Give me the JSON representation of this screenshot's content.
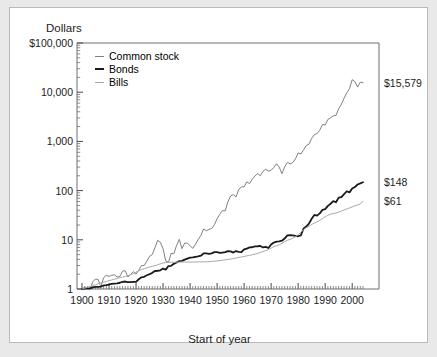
{
  "figure": {
    "y_axis_title": "Dollars",
    "x_axis_title": "Start of year"
  },
  "legend": {
    "items": [
      {
        "label": "Common stock",
        "color": "#808080",
        "width": 1.0
      },
      {
        "label": "Bonds",
        "color": "#1a1a1a",
        "width": 1.8
      },
      {
        "label": "Bills",
        "color": "#a8a8a8",
        "width": 1.0
      }
    ]
  },
  "end_labels": [
    {
      "name": "common-stock-end-label",
      "text": "$15,579",
      "value": 15579,
      "y_px": 80
    },
    {
      "name": "bonds-end-label",
      "text": "$148",
      "value": 148,
      "y_px": 188
    },
    {
      "name": "bills-end-label",
      "text": "$61",
      "value": 61,
      "y_px": 206
    }
  ],
  "chart_data": {
    "type": "line",
    "title": "",
    "xlabel": "Start of year",
    "ylabel": "Dollars",
    "yscale": "log",
    "ylim": [
      1,
      100000
    ],
    "xlim": [
      1900,
      2004
    ],
    "grid": false,
    "legend_position": "top-left inside",
    "ytick_labels": [
      "$100,000",
      "10,000",
      "1,000",
      "100",
      "10",
      "1"
    ],
    "ytick_values": [
      100000,
      10000,
      1000,
      100,
      10,
      1
    ],
    "xtick_labels": [
      "1900",
      "1910",
      "1920",
      "1930",
      "1940",
      "1950",
      "1960",
      "1970",
      "1980",
      "1990",
      "2000"
    ],
    "xtick_values": [
      1900,
      1910,
      1920,
      1930,
      1940,
      1950,
      1960,
      1970,
      1980,
      1990,
      2000
    ],
    "x": [
      1900,
      1901,
      1902,
      1903,
      1904,
      1905,
      1906,
      1907,
      1908,
      1909,
      1910,
      1911,
      1912,
      1913,
      1914,
      1915,
      1916,
      1917,
      1918,
      1919,
      1920,
      1921,
      1922,
      1923,
      1924,
      1925,
      1926,
      1927,
      1928,
      1929,
      1930,
      1931,
      1932,
      1933,
      1934,
      1935,
      1936,
      1937,
      1938,
      1939,
      1940,
      1941,
      1942,
      1943,
      1944,
      1945,
      1946,
      1947,
      1948,
      1949,
      1950,
      1951,
      1952,
      1953,
      1954,
      1955,
      1956,
      1957,
      1958,
      1959,
      1960,
      1961,
      1962,
      1963,
      1964,
      1965,
      1966,
      1967,
      1968,
      1969,
      1970,
      1971,
      1972,
      1973,
      1974,
      1975,
      1976,
      1977,
      1978,
      1979,
      1980,
      1981,
      1982,
      1983,
      1984,
      1985,
      1986,
      1987,
      1988,
      1989,
      1990,
      1991,
      1992,
      1993,
      1994,
      1995,
      1996,
      1997,
      1998,
      1999,
      2000,
      2001,
      2002,
      2003,
      2004
    ],
    "series": [
      {
        "name": "Common stock",
        "color": "#808080",
        "values": [
          1,
          1.07,
          0.95,
          0.9,
          1.4,
          1.6,
          1.55,
          1.1,
          1.7,
          1.9,
          1.8,
          1.9,
          1.95,
          1.75,
          1.8,
          2.3,
          2.35,
          1.75,
          2.0,
          2.25,
          2.0,
          2.4,
          3.0,
          3.0,
          3.7,
          4.6,
          5.0,
          6.9,
          9.8,
          8.9,
          6.6,
          3.7,
          3.5,
          5.3,
          5.2,
          7.7,
          10.2,
          6.6,
          8.6,
          8.5,
          7.6,
          6.7,
          8.1,
          10.2,
          12.2,
          16.6,
          15.3,
          16.2,
          17.0,
          20.2,
          26.7,
          33.1,
          39.2,
          38.8,
          59.2,
          77.9,
          83.0,
          74.0,
          106.0,
          118.7,
          119.3,
          151.4,
          138.2,
          169.6,
          197.8,
          222.6,
          200.1,
          248.1,
          272.0,
          249.0,
          259.0,
          296.0,
          352.0,
          300.0,
          220.6,
          302.8,
          375.3,
          348.6,
          371.4,
          440.0,
          582.8,
          554.0,
          673.2,
          825.1,
          877.4,
          1155.8,
          1371.2,
          1443.3,
          1682.5,
          2214.3,
          2145.5,
          2799.0,
          3013.0,
          3316.0,
          3359.0,
          4620.0,
          5680.0,
          7575.0,
          9740.0,
          11790.0,
          18000.0,
          16350.0,
          12700.0,
          16000.0,
          15579.0
        ]
      },
      {
        "name": "Bonds",
        "color": "#1a1a1a",
        "values": [
          1,
          1.02,
          1.03,
          1.03,
          1.08,
          1.1,
          1.1,
          1.12,
          1.18,
          1.2,
          1.23,
          1.27,
          1.29,
          1.3,
          1.34,
          1.4,
          1.42,
          1.38,
          1.38,
          1.4,
          1.4,
          1.58,
          1.73,
          1.77,
          1.9,
          2.0,
          2.13,
          2.32,
          2.35,
          2.4,
          2.6,
          2.48,
          2.93,
          2.96,
          3.25,
          3.45,
          3.7,
          3.72,
          3.95,
          4.15,
          4.35,
          4.38,
          4.5,
          4.6,
          4.75,
          5.3,
          5.3,
          5.2,
          5.3,
          5.6,
          5.6,
          5.4,
          5.5,
          5.6,
          5.9,
          5.8,
          5.5,
          5.9,
          5.7,
          5.6,
          6.4,
          6.6,
          7.0,
          7.05,
          7.35,
          7.4,
          7.5,
          7.0,
          7.2,
          6.8,
          8.0,
          8.8,
          9.2,
          9.3,
          9.6,
          10.6,
          12.3,
          12.5,
          12.3,
          12.0,
          11.8,
          12.3,
          17.0,
          18.6,
          21.3,
          26.8,
          32.0,
          31.0,
          34.5,
          40.5,
          42.0,
          49.0,
          54.0,
          61.0,
          58.0,
          72.0,
          74.0,
          85.0,
          97.0,
          92.0,
          110.0,
          118.0,
          133.0,
          140.0,
          148.0
        ]
      },
      {
        "name": "Bills",
        "color": "#a8a8a8",
        "values": [
          1,
          1.04,
          1.08,
          1.12,
          1.17,
          1.22,
          1.28,
          1.34,
          1.38,
          1.42,
          1.48,
          1.53,
          1.58,
          1.64,
          1.7,
          1.75,
          1.8,
          1.86,
          1.96,
          2.06,
          2.2,
          2.36,
          2.48,
          2.58,
          2.7,
          2.8,
          2.9,
          3.0,
          3.1,
          3.26,
          3.38,
          3.44,
          3.47,
          3.49,
          3.5,
          3.51,
          3.52,
          3.53,
          3.53,
          3.53,
          3.53,
          3.53,
          3.54,
          3.55,
          3.56,
          3.57,
          3.58,
          3.59,
          3.63,
          3.68,
          3.72,
          3.78,
          3.84,
          3.92,
          4.0,
          4.06,
          4.14,
          4.26,
          4.39,
          4.46,
          4.59,
          4.72,
          4.82,
          4.95,
          5.1,
          5.3,
          5.5,
          5.78,
          6.0,
          6.32,
          6.8,
          7.25,
          7.56,
          7.9,
          8.5,
          9.18,
          9.76,
          10.2,
          10.7,
          11.5,
          12.7,
          14.1,
          16.1,
          17.6,
          18.9,
          20.5,
          21.9,
          23.2,
          24.9,
          27.1,
          29.2,
          31.5,
          33.2,
          34.1,
          35.1,
          36.6,
          38.5,
          40.4,
          42.4,
          44.4,
          46.5,
          49.3,
          51.0,
          53.5,
          61.0
        ]
      }
    ]
  }
}
